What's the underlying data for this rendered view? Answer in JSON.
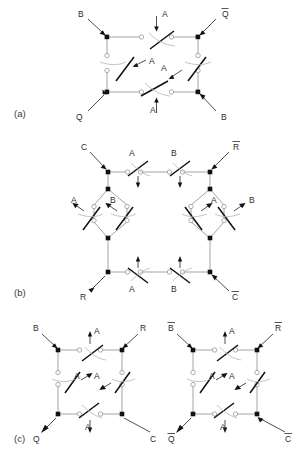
{
  "figure": {
    "type": "relay-switch-circuit-diagrams",
    "background_color": "#ffffff",
    "wire_color": "#9a9a9a",
    "blade_color": "#111111",
    "label_color": "#2b2b2b"
  },
  "panels": [
    {
      "id": "a",
      "caption": "(a)",
      "terminals": [
        {
          "name": "top-left",
          "label": "B",
          "overline": false
        },
        {
          "name": "top-right",
          "label": "Q",
          "overline": true
        },
        {
          "name": "bottom-left",
          "label": "Q",
          "overline": false
        },
        {
          "name": "bottom-right",
          "label": "B",
          "overline": false
        }
      ],
      "switches": [
        {
          "name": "top",
          "label": "A",
          "orientation": "horizontal"
        },
        {
          "name": "left",
          "label": "A",
          "orientation": "vertical"
        },
        {
          "name": "right",
          "label": "A",
          "orientation": "vertical"
        },
        {
          "name": "bottom",
          "label": "A",
          "orientation": "horizontal"
        }
      ]
    },
    {
      "id": "b",
      "caption": "(b)",
      "terminals": [
        {
          "name": "top-left",
          "label": "C",
          "overline": false
        },
        {
          "name": "top-right",
          "label": "R",
          "overline": true
        },
        {
          "name": "bottom-left",
          "label": "R",
          "overline": false
        },
        {
          "name": "bottom-right",
          "label": "C",
          "overline": true
        }
      ],
      "switches": [
        {
          "name": "top-first",
          "label": "A",
          "orientation": "horizontal"
        },
        {
          "name": "top-second",
          "label": "B",
          "orientation": "horizontal"
        },
        {
          "name": "left-branch-outer",
          "label": "A",
          "orientation": "vertical"
        },
        {
          "name": "left-branch-inner",
          "label": "B",
          "orientation": "vertical"
        },
        {
          "name": "right-branch-inner",
          "label": "A",
          "orientation": "vertical"
        },
        {
          "name": "right-branch-outer",
          "label": "B",
          "orientation": "vertical"
        },
        {
          "name": "bottom-first",
          "label": "A",
          "orientation": "horizontal"
        },
        {
          "name": "bottom-second",
          "label": "B",
          "orientation": "horizontal"
        }
      ]
    },
    {
      "id": "c",
      "caption": "(c)",
      "subcircuits": [
        {
          "name": "left",
          "terminals": [
            {
              "name": "top-left",
              "label": "B",
              "overline": false
            },
            {
              "name": "top-right",
              "label": "R",
              "overline": false
            },
            {
              "name": "bottom-left",
              "label": "Q",
              "overline": false
            },
            {
              "name": "bottom-right",
              "label": "C",
              "overline": false
            }
          ],
          "switches": [
            {
              "name": "top",
              "label": "A",
              "orientation": "horizontal"
            },
            {
              "name": "left",
              "label": "A",
              "orientation": "vertical"
            },
            {
              "name": "right",
              "label": "A",
              "orientation": "vertical"
            },
            {
              "name": "bottom",
              "label": "A",
              "orientation": "horizontal"
            }
          ]
        },
        {
          "name": "right",
          "terminals": [
            {
              "name": "top-left",
              "label": "B",
              "overline": true
            },
            {
              "name": "top-right",
              "label": "R",
              "overline": true
            },
            {
              "name": "bottom-left",
              "label": "Q",
              "overline": true
            },
            {
              "name": "bottom-right",
              "label": "C",
              "overline": true
            }
          ],
          "switches": [
            {
              "name": "top",
              "label": "A",
              "orientation": "horizontal"
            },
            {
              "name": "left",
              "label": "A",
              "orientation": "vertical"
            },
            {
              "name": "right",
              "label": "A",
              "orientation": "vertical"
            },
            {
              "name": "bottom",
              "label": "A",
              "orientation": "horizontal"
            }
          ]
        }
      ]
    }
  ]
}
